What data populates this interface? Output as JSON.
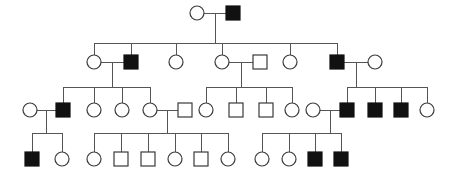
{
  "diagram": {
    "type": "pedigree",
    "legend": {
      "male_shape": "square",
      "female_shape": "circle",
      "affected_fill": "#111111",
      "unaffected_fill": "#ffffff",
      "line_color": "#555555"
    },
    "canvas": {
      "width": 451,
      "height": 179
    },
    "symbol_size": 14,
    "generations": [
      {
        "id": "I",
        "label": "I",
        "y": 13,
        "individuals": [
          {
            "id": "I-1",
            "sex": "female",
            "shape": "circle",
            "affected": false,
            "x": 197,
            "y": 13
          },
          {
            "id": "I-2",
            "sex": "male",
            "shape": "square",
            "affected": true,
            "x": 233,
            "y": 13
          }
        ]
      },
      {
        "id": "II",
        "label": "II",
        "y": 62,
        "individuals": [
          {
            "id": "II-1",
            "sex": "female",
            "shape": "circle",
            "affected": false,
            "x": 94,
            "y": 62
          },
          {
            "id": "II-2",
            "sex": "male",
            "shape": "square",
            "affected": true,
            "x": 131,
            "y": 62
          },
          {
            "id": "II-3",
            "sex": "female",
            "shape": "circle",
            "affected": false,
            "x": 176,
            "y": 62
          },
          {
            "id": "II-4",
            "sex": "female",
            "shape": "circle",
            "affected": false,
            "x": 222,
            "y": 62
          },
          {
            "id": "II-5",
            "sex": "male",
            "shape": "square",
            "affected": false,
            "x": 260,
            "y": 62
          },
          {
            "id": "II-6",
            "sex": "female",
            "shape": "circle",
            "affected": false,
            "x": 290,
            "y": 62
          },
          {
            "id": "II-7",
            "sex": "male",
            "shape": "square",
            "affected": true,
            "x": 337,
            "y": 62
          },
          {
            "id": "II-8",
            "sex": "female",
            "shape": "circle",
            "affected": false,
            "x": 375,
            "y": 62
          }
        ]
      },
      {
        "id": "III",
        "label": "III",
        "y": 110,
        "individuals": [
          {
            "id": "III-1",
            "sex": "female",
            "shape": "circle",
            "affected": false,
            "x": 30,
            "y": 110
          },
          {
            "id": "III-2",
            "sex": "male",
            "shape": "square",
            "affected": true,
            "x": 63,
            "y": 110
          },
          {
            "id": "III-3",
            "sex": "female",
            "shape": "circle",
            "affected": false,
            "x": 94,
            "y": 110
          },
          {
            "id": "III-4",
            "sex": "female",
            "shape": "circle",
            "affected": false,
            "x": 122,
            "y": 110
          },
          {
            "id": "III-5",
            "sex": "female",
            "shape": "circle",
            "affected": false,
            "x": 150,
            "y": 110
          },
          {
            "id": "III-6",
            "sex": "male",
            "shape": "square",
            "affected": false,
            "x": 185,
            "y": 110
          },
          {
            "id": "III-7",
            "sex": "female",
            "shape": "circle",
            "affected": false,
            "x": 206,
            "y": 110
          },
          {
            "id": "III-8",
            "sex": "male",
            "shape": "square",
            "affected": false,
            "x": 236,
            "y": 110
          },
          {
            "id": "III-9",
            "sex": "male",
            "shape": "square",
            "affected": false,
            "x": 266,
            "y": 110
          },
          {
            "id": "III-10",
            "sex": "female",
            "shape": "circle",
            "affected": false,
            "x": 292,
            "y": 110
          },
          {
            "id": "III-11",
            "sex": "female",
            "shape": "circle",
            "affected": false,
            "x": 313,
            "y": 110
          },
          {
            "id": "III-12",
            "sex": "male",
            "shape": "square",
            "affected": true,
            "x": 347,
            "y": 110
          },
          {
            "id": "III-13",
            "sex": "male",
            "shape": "square",
            "affected": true,
            "x": 375,
            "y": 110
          },
          {
            "id": "III-14",
            "sex": "male",
            "shape": "square",
            "affected": true,
            "x": 401,
            "y": 110
          },
          {
            "id": "III-15",
            "sex": "female",
            "shape": "circle",
            "affected": false,
            "x": 427,
            "y": 110
          }
        ]
      },
      {
        "id": "IV",
        "label": "IV",
        "y": 159,
        "individuals": [
          {
            "id": "IV-1",
            "sex": "male",
            "shape": "square",
            "affected": true,
            "x": 32,
            "y": 159
          },
          {
            "id": "IV-2",
            "sex": "female",
            "shape": "circle",
            "affected": false,
            "x": 62,
            "y": 159
          },
          {
            "id": "IV-3",
            "sex": "female",
            "shape": "circle",
            "affected": false,
            "x": 94,
            "y": 159
          },
          {
            "id": "IV-4",
            "sex": "male",
            "shape": "square",
            "affected": false,
            "x": 121,
            "y": 159
          },
          {
            "id": "IV-5",
            "sex": "male",
            "shape": "square",
            "affected": false,
            "x": 148,
            "y": 159
          },
          {
            "id": "IV-6",
            "sex": "female",
            "shape": "circle",
            "affected": false,
            "x": 175,
            "y": 159
          },
          {
            "id": "IV-7",
            "sex": "male",
            "shape": "square",
            "affected": false,
            "x": 201,
            "y": 159
          },
          {
            "id": "IV-8",
            "sex": "female",
            "shape": "circle",
            "affected": false,
            "x": 228,
            "y": 159
          },
          {
            "id": "IV-9",
            "sex": "female",
            "shape": "circle",
            "affected": false,
            "x": 262,
            "y": 159
          },
          {
            "id": "IV-10",
            "sex": "female",
            "shape": "circle",
            "affected": false,
            "x": 289,
            "y": 159
          },
          {
            "id": "IV-11",
            "sex": "male",
            "shape": "square",
            "affected": true,
            "x": 315,
            "y": 159
          },
          {
            "id": "IV-12",
            "sex": "male",
            "shape": "square",
            "affected": true,
            "x": 341,
            "y": 159
          }
        ]
      }
    ],
    "matings": [
      {
        "id": "M1",
        "partners": [
          "I-1",
          "I-2"
        ],
        "x1": 197,
        "x2": 233,
        "y": 13,
        "drop_x": 215,
        "drop_to": 43
      },
      {
        "id": "M2",
        "partners": [
          "II-1",
          "II-2"
        ],
        "x1": 94,
        "x2": 131,
        "y": 62,
        "drop_x": 112,
        "drop_to": 87
      },
      {
        "id": "M3",
        "partners": [
          "II-4",
          "II-5"
        ],
        "x1": 222,
        "x2": 260,
        "y": 62,
        "drop_x": 241,
        "drop_to": 87
      },
      {
        "id": "M4",
        "partners": [
          "II-7",
          "II-8"
        ],
        "x1": 337,
        "x2": 375,
        "y": 62,
        "drop_x": 356,
        "drop_to": 87
      },
      {
        "id": "M5",
        "partners": [
          "III-1",
          "III-2"
        ],
        "x1": 30,
        "x2": 63,
        "y": 110,
        "drop_x": 46,
        "drop_to": 133
      },
      {
        "id": "M6",
        "partners": [
          "III-5",
          "III-6"
        ],
        "x1": 150,
        "x2": 185,
        "y": 110,
        "drop_x": 167,
        "drop_to": 133
      },
      {
        "id": "M7",
        "partners": [
          "III-11",
          "III-12"
        ],
        "x1": 313,
        "x2": 347,
        "y": 110,
        "drop_x": 330,
        "drop_to": 133
      }
    ],
    "sibships": [
      {
        "id": "S1",
        "parents": "M1",
        "bar_y": 43,
        "x_from": 94,
        "x_to": 337,
        "children_x": [
          94,
          131,
          176,
          222,
          290,
          337
        ],
        "child_top": 55
      },
      {
        "id": "S2",
        "parents": "M2",
        "bar_y": 87,
        "x_from": 63,
        "x_to": 150,
        "children_x": [
          63,
          94,
          122,
          150
        ],
        "child_top": 103
      },
      {
        "id": "S3",
        "parents": "M3",
        "bar_y": 87,
        "x_from": 206,
        "x_to": 292,
        "children_x": [
          206,
          236,
          266,
          292
        ],
        "child_top": 103
      },
      {
        "id": "S4",
        "parents": "M4",
        "bar_y": 87,
        "x_from": 347,
        "x_to": 427,
        "children_x": [
          347,
          375,
          401,
          427
        ],
        "child_top": 103
      },
      {
        "id": "S5",
        "parents": "M5",
        "bar_y": 133,
        "x_from": 32,
        "x_to": 62,
        "children_x": [
          32,
          62
        ],
        "child_top": 152
      },
      {
        "id": "S6",
        "parents": "M6",
        "bar_y": 133,
        "x_from": 94,
        "x_to": 228,
        "children_x": [
          94,
          121,
          148,
          175,
          201,
          228
        ],
        "child_top": 152
      },
      {
        "id": "S7",
        "parents": "M7",
        "bar_y": 133,
        "x_from": 262,
        "x_to": 341,
        "children_x": [
          262,
          289,
          315,
          341
        ],
        "child_top": 152
      }
    ]
  }
}
